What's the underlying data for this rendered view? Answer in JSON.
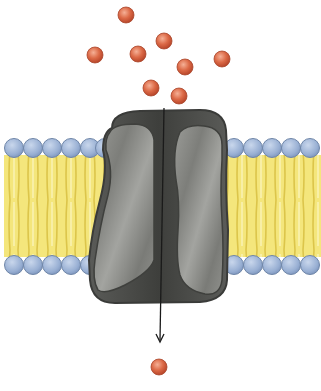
{
  "diagram": {
    "type": "channel-protein-membrane-transport",
    "colors": {
      "background": "#ffffff",
      "solute": "#d9603f",
      "solute_highlight": "#f2a88a",
      "phospholipid_head": "#9fb6d8",
      "phospholipid_head_stroke": "#6f86a8",
      "lipid_tail": "#f2e47a",
      "lipid_tail_line": "#e0c94a",
      "protein_outer": "#4d4e4b",
      "protein_subunit": "#8a8b87",
      "protein_stroke": "#3a3b39",
      "arrow": "#1a1a1a"
    },
    "solutes_outside": [
      {
        "x": 126,
        "y": 15
      },
      {
        "x": 95,
        "y": 55
      },
      {
        "x": 138,
        "y": 54
      },
      {
        "x": 164,
        "y": 41
      },
      {
        "x": 185,
        "y": 67
      },
      {
        "x": 222,
        "y": 59
      },
      {
        "x": 151,
        "y": 88
      },
      {
        "x": 179,
        "y": 96
      }
    ],
    "solutes_inside": [
      {
        "x": 159,
        "y": 367
      }
    ],
    "membrane": {
      "top_heads_y": 148,
      "bottom_heads_y": 265,
      "left_heads_x": [
        14,
        33,
        52,
        71,
        90,
        105
      ],
      "right_heads_x": [
        234,
        253,
        272,
        291,
        310
      ]
    },
    "arrow": {
      "x1": 164,
      "y1": 108,
      "x2": 160,
      "y2": 342
    }
  }
}
